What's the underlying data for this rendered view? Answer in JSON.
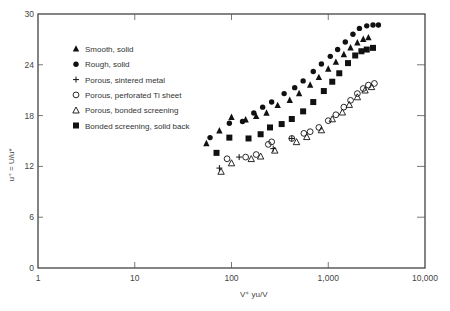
{
  "chart_data": {
    "type": "scatter",
    "title": "",
    "xlabel": "V⁺  yu/V",
    "ylabel": "u⁺ = U/u*",
    "xscale": "log",
    "xlim": [
      1,
      10000
    ],
    "ylim": [
      0,
      30
    ],
    "x_ticks": [
      "1",
      "10",
      "100",
      "1,000",
      "10,000"
    ],
    "y_ticks": [
      "0",
      "6",
      "12",
      "18",
      "24",
      "30"
    ],
    "grid": false,
    "legend_position": "upper-left inside",
    "series": [
      {
        "name": "Smooth, solid",
        "marker": "filled-triangle",
        "points": [
          [
            55,
            14.7
          ],
          [
            75,
            16.2
          ],
          [
            100,
            17.8
          ],
          [
            140,
            17.5
          ],
          [
            180,
            17.9
          ],
          [
            230,
            18.3
          ],
          [
            300,
            19.2
          ],
          [
            400,
            19.8
          ],
          [
            500,
            20.6
          ],
          [
            650,
            21.6
          ],
          [
            800,
            22.5
          ],
          [
            1000,
            23.5
          ],
          [
            1200,
            24.3
          ],
          [
            1450,
            25.2
          ],
          [
            1700,
            26.0
          ],
          [
            2000,
            26.6
          ],
          [
            2300,
            27.0
          ],
          [
            2600,
            27.2
          ]
        ]
      },
      {
        "name": "Rough, solid",
        "marker": "filled-circle",
        "points": [
          [
            60,
            15.4
          ],
          [
            95,
            17.1
          ],
          [
            130,
            17.3
          ],
          [
            170,
            18.3
          ],
          [
            210,
            19.0
          ],
          [
            260,
            19.6
          ],
          [
            350,
            20.6
          ],
          [
            450,
            21.3
          ],
          [
            550,
            22.1
          ],
          [
            700,
            23.2
          ],
          [
            850,
            24.1
          ],
          [
            1050,
            25.0
          ],
          [
            1250,
            25.8
          ],
          [
            1500,
            26.7
          ],
          [
            1800,
            27.6
          ],
          [
            2100,
            28.3
          ],
          [
            2500,
            28.6
          ],
          [
            2900,
            28.7
          ],
          [
            3300,
            28.7
          ]
        ]
      },
      {
        "name": "Porous, sintered metal",
        "marker": "plus",
        "points": [
          [
            75,
            11.8
          ],
          [
            120,
            13.1
          ],
          [
            270,
            14.1
          ],
          [
            420,
            15.3
          ]
        ]
      },
      {
        "name": "Porous, perforated Ti sheet",
        "marker": "open-circle",
        "points": [
          [
            90,
            12.9
          ],
          [
            140,
            13.1
          ],
          [
            180,
            13.4
          ],
          [
            240,
            14.6
          ],
          [
            260,
            14.9
          ],
          [
            420,
            15.3
          ],
          [
            560,
            15.9
          ],
          [
            650,
            16.1
          ],
          [
            800,
            16.6
          ],
          [
            1000,
            17.4
          ],
          [
            1200,
            18.1
          ],
          [
            1450,
            19.0
          ],
          [
            1700,
            19.8
          ],
          [
            2000,
            20.6
          ],
          [
            2300,
            21.2
          ],
          [
            2600,
            21.6
          ],
          [
            3000,
            21.8
          ]
        ]
      },
      {
        "name": "Porous, bonded screening",
        "marker": "open-triangle",
        "points": [
          [
            78,
            11.4
          ],
          [
            100,
            12.4
          ],
          [
            160,
            12.9
          ],
          [
            200,
            13.2
          ],
          [
            280,
            13.9
          ],
          [
            470,
            14.9
          ],
          [
            600,
            15.5
          ],
          [
            850,
            16.3
          ],
          [
            1100,
            17.6
          ],
          [
            1400,
            18.4
          ],
          [
            1650,
            19.3
          ],
          [
            2000,
            20.2
          ],
          [
            2400,
            21.0
          ],
          [
            2800,
            21.4
          ]
        ]
      },
      {
        "name": "Bonded screening, solid back",
        "marker": "filled-square",
        "points": [
          [
            70,
            13.6
          ],
          [
            95,
            15.4
          ],
          [
            150,
            15.3
          ],
          [
            200,
            15.8
          ],
          [
            250,
            16.6
          ],
          [
            330,
            17.0
          ],
          [
            420,
            17.6
          ],
          [
            550,
            18.5
          ],
          [
            700,
            19.6
          ],
          [
            900,
            20.9
          ],
          [
            1100,
            22.0
          ],
          [
            1300,
            23.0
          ],
          [
            1600,
            24.2
          ],
          [
            1900,
            25.1
          ],
          [
            2200,
            25.6
          ],
          [
            2500,
            25.8
          ],
          [
            2900,
            26.0
          ]
        ]
      }
    ]
  }
}
